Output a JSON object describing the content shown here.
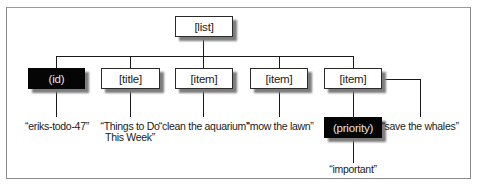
{
  "diagram": {
    "root": {
      "label": "[list]",
      "style": "white"
    },
    "children": [
      {
        "label": "(id)",
        "style": "black",
        "value": "“eriks-todo-47”"
      },
      {
        "label": "[title]",
        "style": "white",
        "value_line1": "“Things to Do",
        "value_line2": "This Week”"
      },
      {
        "label": "[item]",
        "style": "white",
        "value": "“clean the aquarium”"
      },
      {
        "label": "[item]",
        "style": "white",
        "value": "“mow the lawn”"
      },
      {
        "label": "[item]",
        "style": "white",
        "value": "“save the whales”",
        "attribute": {
          "label": "(priority)",
          "style": "black",
          "value": "“important”"
        }
      }
    ]
  },
  "colors": {
    "line": "#1a1a1a",
    "dark_node": "#050505",
    "shadow": "#7d7d7d",
    "frame": "#8a8a8a"
  }
}
